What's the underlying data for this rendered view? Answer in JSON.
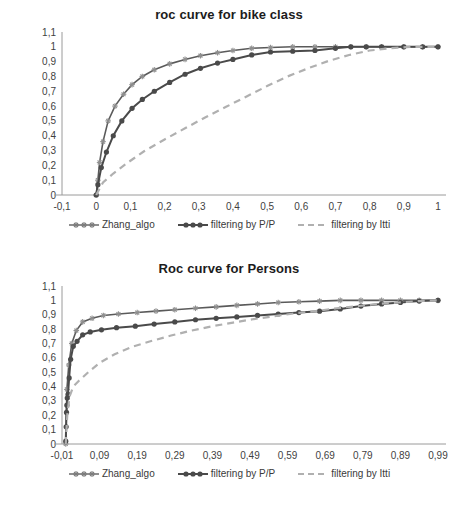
{
  "charts": [
    {
      "id": "bike",
      "title": "roc curve for bike class",
      "ylabel": "",
      "xlabel": "",
      "yticks": [
        "1,1",
        "1",
        "0,9",
        "0,8",
        "0,7",
        "0,6",
        "0,5",
        "0,4",
        "0,3",
        "0,2",
        "0,1",
        "0"
      ],
      "xticks": [
        "-0,1",
        "0",
        "0,1",
        "0,2",
        "0,3",
        "0,4",
        "0,5",
        "0,6",
        "0,7",
        "0,8",
        "0,9",
        "1"
      ],
      "legend": [
        {
          "label": "Zhang_algo",
          "key": "line-with-star-markers",
          "color": "#8f8f8f"
        },
        {
          "label": "filtering by P/P",
          "key": "line-with-dot-markers",
          "color": "#4a4a4a"
        },
        {
          "label": "filtering by Itti",
          "key": "dashed-line",
          "color": "#b0b0b0"
        }
      ]
    },
    {
      "id": "persons",
      "title": "Roc curve for Persons",
      "ylabel": "",
      "xlabel": "",
      "yticks": [
        "1,1",
        "1",
        "0,9",
        "0,8",
        "0,7",
        "0,6",
        "0,5",
        "0,4",
        "0,3",
        "0,2",
        "0,1",
        "0"
      ],
      "xticks": [
        "-0,01",
        "0,09",
        "0,19",
        "0,29",
        "0,39",
        "0,49",
        "0,59",
        "0,69",
        "0,79",
        "0,89",
        "0,99"
      ],
      "legend": [
        {
          "label": "Zhang_algo",
          "key": "line-with-star-markers",
          "color": "#8f8f8f"
        },
        {
          "label": "filtering by P/P",
          "key": "line-with-dot-markers",
          "color": "#4a4a4a"
        },
        {
          "label": "filtering by Itti",
          "key": "dashed-line",
          "color": "#b0b0b0"
        }
      ]
    }
  ],
  "chart_data": [
    {
      "type": "line",
      "title": "roc curve for bike class",
      "xlabel": "",
      "ylabel": "",
      "xlim": [
        -0.1,
        1.0
      ],
      "ylim": [
        0,
        1.1
      ],
      "xticks": [
        -0.1,
        0,
        0.1,
        0.2,
        0.3,
        0.4,
        0.5,
        0.6,
        0.7,
        0.8,
        0.9,
        1.0
      ],
      "yticks": [
        0,
        0.1,
        0.2,
        0.3,
        0.4,
        0.5,
        0.6,
        0.7,
        0.8,
        0.9,
        1.0,
        1.1
      ],
      "grid": false,
      "legend_position": "bottom",
      "series": [
        {
          "name": "Zhang_algo",
          "style": "solid-with-star-markers",
          "color": "#8f8f8f",
          "x": [
            0.0,
            0.005,
            0.01,
            0.02,
            0.035,
            0.055,
            0.08,
            0.105,
            0.135,
            0.17,
            0.215,
            0.26,
            0.305,
            0.355,
            0.4,
            0.455,
            0.51,
            0.575,
            0.64,
            0.7,
            0.745,
            0.79,
            0.835,
            0.9,
            0.955,
            1.0
          ],
          "y": [
            0.0,
            0.1,
            0.22,
            0.36,
            0.5,
            0.6,
            0.68,
            0.745,
            0.8,
            0.845,
            0.885,
            0.915,
            0.94,
            0.96,
            0.975,
            0.99,
            0.995,
            1.0,
            1.0,
            1.0,
            1.0,
            1.0,
            1.0,
            1.0,
            1.0,
            1.0
          ]
        },
        {
          "name": "filtering by P/P",
          "style": "solid-with-dot-markers",
          "color": "#4a4a4a",
          "x": [
            0.0,
            0.005,
            0.015,
            0.03,
            0.05,
            0.075,
            0.105,
            0.135,
            0.17,
            0.215,
            0.26,
            0.305,
            0.355,
            0.4,
            0.455,
            0.51,
            0.575,
            0.64,
            0.7,
            0.745,
            0.79,
            0.835,
            0.9,
            0.955,
            1.0
          ],
          "y": [
            0.0,
            0.07,
            0.185,
            0.29,
            0.4,
            0.5,
            0.585,
            0.645,
            0.7,
            0.76,
            0.815,
            0.855,
            0.89,
            0.915,
            0.945,
            0.965,
            0.97,
            0.975,
            0.99,
            1.0,
            1.0,
            1.0,
            1.0,
            1.0,
            1.0
          ]
        },
        {
          "name": "filtering by Itti",
          "style": "dashed",
          "color": "#b0b0b0",
          "x": [
            0.0,
            0.02,
            0.05,
            0.09,
            0.14,
            0.2,
            0.26,
            0.32,
            0.38,
            0.44,
            0.5,
            0.56,
            0.62,
            0.68,
            0.74,
            0.8,
            0.86,
            0.92,
            1.0
          ],
          "y": [
            0.0,
            0.085,
            0.145,
            0.215,
            0.295,
            0.375,
            0.45,
            0.525,
            0.595,
            0.665,
            0.735,
            0.8,
            0.855,
            0.905,
            0.945,
            0.975,
            0.99,
            1.0,
            1.0
          ]
        }
      ]
    },
    {
      "type": "line",
      "title": "Roc curve for Persons",
      "xlabel": "",
      "ylabel": "",
      "xlim": [
        -0.01,
        0.99
      ],
      "ylim": [
        0,
        1.1
      ],
      "xticks": [
        -0.01,
        0.09,
        0.19,
        0.29,
        0.39,
        0.49,
        0.59,
        0.69,
        0.79,
        0.89,
        0.99
      ],
      "yticks": [
        0,
        0.1,
        0.2,
        0.3,
        0.4,
        0.5,
        0.6,
        0.7,
        0.8,
        0.9,
        1.0,
        1.1
      ],
      "grid": false,
      "legend_position": "bottom",
      "series": [
        {
          "name": "Zhang_algo",
          "style": "solid-with-star-markers",
          "color": "#8f8f8f",
          "x": [
            0.0,
            0.003,
            0.008,
            0.016,
            0.028,
            0.045,
            0.07,
            0.1,
            0.14,
            0.19,
            0.24,
            0.29,
            0.345,
            0.4,
            0.455,
            0.51,
            0.565,
            0.62,
            0.675,
            0.73,
            0.785,
            0.84,
            0.89,
            0.94,
            0.99
          ],
          "y": [
            0.0,
            0.38,
            0.55,
            0.7,
            0.79,
            0.85,
            0.875,
            0.895,
            0.905,
            0.915,
            0.925,
            0.935,
            0.945,
            0.955,
            0.965,
            0.975,
            0.985,
            0.99,
            0.995,
            1.0,
            1.0,
            1.0,
            1.0,
            1.0,
            1.0
          ]
        },
        {
          "name": "filtering by P/P",
          "style": "solid-with-dot-markers",
          "color": "#4a4a4a",
          "x": [
            0.0,
            0.001,
            0.002,
            0.003,
            0.004,
            0.006,
            0.009,
            0.013,
            0.02,
            0.03,
            0.045,
            0.065,
            0.095,
            0.135,
            0.185,
            0.235,
            0.29,
            0.345,
            0.4,
            0.455,
            0.51,
            0.565,
            0.62,
            0.675,
            0.73,
            0.785,
            0.84,
            0.89,
            0.94,
            0.99
          ],
          "y": [
            0.02,
            0.12,
            0.22,
            0.27,
            0.32,
            0.345,
            0.46,
            0.59,
            0.68,
            0.715,
            0.76,
            0.78,
            0.795,
            0.81,
            0.82,
            0.835,
            0.85,
            0.865,
            0.875,
            0.885,
            0.895,
            0.905,
            0.915,
            0.925,
            0.94,
            0.96,
            0.975,
            0.985,
            0.995,
            1.0
          ]
        },
        {
          "name": "filtering by Itti",
          "style": "dashed",
          "color": "#b0b0b0",
          "x": [
            0.0,
            0.004,
            0.01,
            0.02,
            0.035,
            0.06,
            0.09,
            0.13,
            0.175,
            0.225,
            0.28,
            0.335,
            0.39,
            0.445,
            0.5,
            0.555,
            0.61,
            0.665,
            0.72,
            0.775,
            0.83,
            0.885,
            0.94,
            0.99
          ],
          "y": [
            0.0,
            0.2,
            0.33,
            0.4,
            0.44,
            0.5,
            0.565,
            0.625,
            0.675,
            0.715,
            0.755,
            0.79,
            0.82,
            0.845,
            0.87,
            0.89,
            0.91,
            0.925,
            0.945,
            0.96,
            0.975,
            0.985,
            0.995,
            1.0
          ]
        }
      ]
    }
  ]
}
